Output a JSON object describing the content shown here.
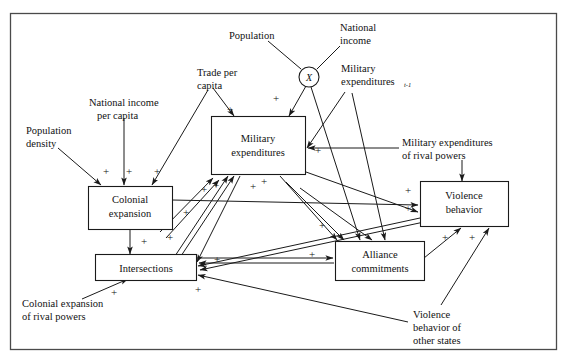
{
  "diagram": {
    "type": "path-diagram",
    "frame": {
      "stroke": "#4a4a4a"
    },
    "boxes": [
      {
        "id": "military-expenditures",
        "lines": [
          "Military",
          "expenditures"
        ]
      },
      {
        "id": "colonial-expansion",
        "lines": [
          "Colonial",
          "expansion"
        ]
      },
      {
        "id": "intersections",
        "lines": [
          "Intersections"
        ]
      },
      {
        "id": "alliance-commitments",
        "lines": [
          "Alliance",
          "commitments"
        ]
      },
      {
        "id": "violence-behavior",
        "lines": [
          "Violence",
          "behavior"
        ]
      }
    ],
    "nodes": [
      {
        "id": "multiplier-node",
        "label": "X"
      }
    ],
    "exogenous_labels": [
      {
        "id": "population",
        "lines": [
          "Population"
        ]
      },
      {
        "id": "national-income",
        "lines": [
          "National",
          "income"
        ]
      },
      {
        "id": "trade-per-capita",
        "lines": [
          "Trade per",
          "capita"
        ]
      },
      {
        "id": "national-income-per-capita",
        "lines": [
          "National income",
          "per capita"
        ]
      },
      {
        "id": "population-density",
        "lines": [
          "Population",
          "density"
        ]
      },
      {
        "id": "military-expenditures-lagged",
        "lines": [
          "Military",
          "expenditures"
        ],
        "subscript": "t-1"
      },
      {
        "id": "military-expenditures-rival-powers",
        "lines": [
          "Military expenditures",
          "of rival powers"
        ]
      },
      {
        "id": "colonial-expansion-rival-powers",
        "lines": [
          "Colonial expansion",
          "of rival powers"
        ]
      },
      {
        "id": "violence-behavior-other-states",
        "lines": [
          "Violence",
          "behavior of",
          "other states"
        ]
      }
    ],
    "sign_symbol": "+",
    "sign_count": 22,
    "signs": [
      "+",
      "+",
      "+",
      "+",
      "+",
      "+",
      "+",
      "+",
      "+",
      "+",
      "+",
      "+",
      "+",
      "+",
      "+",
      "+",
      "+",
      "+",
      "+",
      "+",
      "+",
      "+"
    ]
  }
}
